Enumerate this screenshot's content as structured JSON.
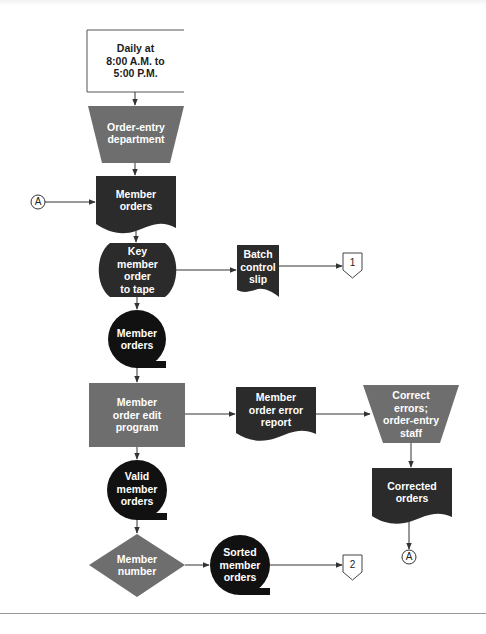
{
  "figure": {
    "type": "system flowchart",
    "colors": {
      "process_gray": "#6e6e6e",
      "dark_shape": "#2b2b2b",
      "tape_black": "#111111",
      "line": "#333333",
      "text_light": "#ffffff",
      "text_dark": "#1c1c1c",
      "background": "#ffffff"
    }
  },
  "nodes": {
    "schedule": {
      "shape": "annotation",
      "label": "Daily at\n8:00 A.M. to\n5:00 P.M."
    },
    "order_entry_dept": {
      "shape": "manual-operation",
      "label": "Order-entry\ndepartment"
    },
    "member_orders_doc": {
      "shape": "document",
      "label": "Member\norders"
    },
    "key_to_tape": {
      "shape": "keying-operation",
      "label": "Key\nmember\norder\nto tape"
    },
    "batch_control_slip": {
      "shape": "document",
      "label": "Batch\ncontrol\nslip"
    },
    "offpage_1": {
      "shape": "off-page-connector",
      "label": "1"
    },
    "member_orders_tape": {
      "shape": "magnetic-tape",
      "label": "Member\norders"
    },
    "edit_program": {
      "shape": "process",
      "label": "Member\norder edit\nprogram"
    },
    "error_report": {
      "shape": "document",
      "label": "Member\norder error\nreport"
    },
    "correct_errors": {
      "shape": "manual-operation",
      "label": "Correct\nerrors;\norder-entry\nstaff"
    },
    "corrected_orders": {
      "shape": "document",
      "label": "Corrected\norders"
    },
    "connector_a_bottom": {
      "shape": "on-page-connector",
      "label": "A"
    },
    "connector_a_left": {
      "shape": "on-page-connector",
      "label": "A"
    },
    "valid_orders_tape": {
      "shape": "magnetic-tape",
      "label": "Valid\nmember\norders"
    },
    "member_number_sort": {
      "shape": "decision/sort",
      "label": "Member\nnumber"
    },
    "sorted_orders_tape": {
      "shape": "magnetic-tape",
      "label": "Sorted\nmember\norders"
    },
    "offpage_2": {
      "shape": "off-page-connector",
      "label": "2"
    }
  },
  "edges": [
    {
      "from": "schedule",
      "to": "order_entry_dept"
    },
    {
      "from": "order_entry_dept",
      "to": "member_orders_doc"
    },
    {
      "from": "connector_a_left",
      "to": "member_orders_doc"
    },
    {
      "from": "member_orders_doc",
      "to": "key_to_tape"
    },
    {
      "from": "key_to_tape",
      "to": "batch_control_slip"
    },
    {
      "from": "batch_control_slip",
      "to": "offpage_1"
    },
    {
      "from": "key_to_tape",
      "to": "member_orders_tape"
    },
    {
      "from": "member_orders_tape",
      "to": "edit_program"
    },
    {
      "from": "edit_program",
      "to": "error_report"
    },
    {
      "from": "error_report",
      "to": "correct_errors"
    },
    {
      "from": "correct_errors",
      "to": "corrected_orders"
    },
    {
      "from": "corrected_orders",
      "to": "connector_a_bottom"
    },
    {
      "from": "edit_program",
      "to": "valid_orders_tape"
    },
    {
      "from": "valid_orders_tape",
      "to": "member_number_sort"
    },
    {
      "from": "member_number_sort",
      "to": "sorted_orders_tape"
    },
    {
      "from": "sorted_orders_tape",
      "to": "offpage_2"
    }
  ]
}
